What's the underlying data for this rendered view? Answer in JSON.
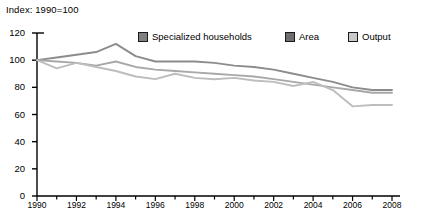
{
  "note": "Index: 1990=100",
  "legend": {
    "items": [
      {
        "label": "Specialized households",
        "color": "#8c8c8c",
        "swatch": "#808080"
      },
      {
        "label": "Area",
        "color": "#a8a8a8",
        "swatch": "#6e6e6e"
      },
      {
        "label": "Output",
        "color": "#bdbdbd",
        "swatch": "#c9c9c9"
      }
    ]
  },
  "axes": {
    "y_ticks": [
      "120",
      "100",
      "80",
      "60",
      "40",
      "20",
      "0"
    ],
    "x_ticks": [
      "1990",
      "1992",
      "1994",
      "1996",
      "1998",
      "2000",
      "2002",
      "2004",
      "2006",
      "2008"
    ]
  },
  "chart_data": {
    "type": "line",
    "title": "",
    "subtitle": "Index: 1990=100",
    "xlabel": "",
    "ylabel": "",
    "ylim": [
      0,
      120
    ],
    "xlim": [
      1990,
      2008
    ],
    "ytick_step": 20,
    "grid": false,
    "legend_position": "top",
    "x": [
      1990,
      1991,
      1992,
      1993,
      1994,
      1995,
      1996,
      1997,
      1998,
      1999,
      2000,
      2001,
      2002,
      2003,
      2004,
      2005,
      2006,
      2007,
      2008
    ],
    "series": [
      {
        "name": "Specialized households",
        "color": "#8c8c8c",
        "values": [
          100,
          102,
          104,
          106,
          112,
          103,
          99,
          99,
          99,
          98,
          96,
          95,
          93,
          90,
          87,
          84,
          80,
          78,
          78
        ]
      },
      {
        "name": "Area",
        "color": "#a8a8a8",
        "values": [
          100,
          99,
          98,
          96,
          99,
          95,
          93,
          92,
          91,
          90,
          89,
          88,
          86,
          84,
          82,
          80,
          78,
          76,
          76
        ]
      },
      {
        "name": "Output",
        "color": "#bdbdbd",
        "values": [
          100,
          94,
          98,
          95,
          92,
          88,
          86,
          90,
          87,
          86,
          87,
          85,
          84,
          81,
          84,
          78,
          66,
          67,
          67
        ]
      }
    ]
  }
}
